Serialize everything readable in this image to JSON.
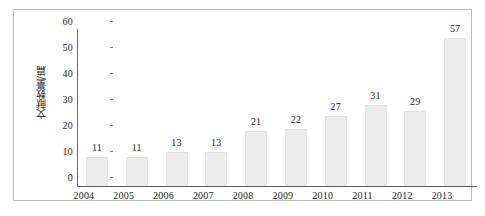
{
  "chart_data": {
    "type": "bar",
    "title": "",
    "subtitle": "",
    "xlabel": "",
    "ylabel": "文献数量/篇",
    "categories": [
      "2004",
      "2005",
      "2006",
      "2007",
      "2008",
      "2009",
      "2010",
      "2011",
      "2012",
      "2013"
    ],
    "values": [
      11,
      11,
      13,
      13,
      21,
      22,
      27,
      31,
      29,
      57
    ],
    "value_labels": [
      "11",
      "11",
      "13",
      "13",
      "21",
      "22",
      "27",
      "31",
      "29",
      "57"
    ],
    "ylim": [
      0,
      60
    ],
    "y_ticks": [
      0,
      10,
      20,
      30,
      40,
      50,
      60
    ],
    "y_tick_labels": [
      "0",
      "10",
      "20",
      "30",
      "40",
      "50",
      "60"
    ],
    "grid": false,
    "legend": null,
    "legend_position": "none",
    "bar_color": "#ebebeb",
    "axis_color": "#5a5a5a",
    "text_color": "#1f1f1f",
    "frame_color": "#b9b9b9",
    "background": "#ffffff"
  }
}
